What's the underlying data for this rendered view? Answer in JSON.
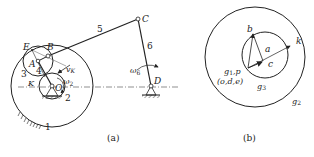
{
  "figure_a": {
    "caption": "(a)",
    "points": {
      "E": "E",
      "B": "B",
      "A": "A",
      "C": "C",
      "D": "D",
      "K": "K",
      "O": "O"
    },
    "links": {
      "l1": "1",
      "l2": "2",
      "l3": "3",
      "l4": "4",
      "l5": "5",
      "l6": "6"
    },
    "vectors": {
      "vK": "v",
      "vK_sub": "K",
      "omega2": "ω",
      "omega2_sub": "2",
      "omega6": "ω",
      "omega6_sub": "6"
    }
  },
  "figure_b": {
    "caption": "(b)",
    "points": {
      "b": "b",
      "a": "a",
      "k": "k",
      "c": "c",
      "g1p": "g",
      "g1p_sub": "1",
      "g1p_rest": ",p",
      "ode": "(o,d,e)",
      "g3": "g",
      "g3_sub": "3",
      "g2": "g",
      "g2_sub": "2"
    }
  },
  "colors": {
    "line": "#222222",
    "background": "#ffffff"
  }
}
